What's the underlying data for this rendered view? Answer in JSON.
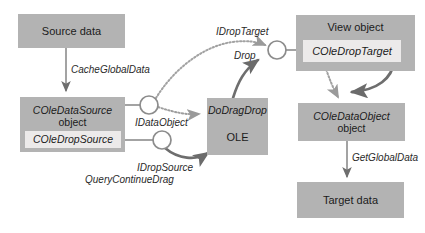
{
  "diagram": {
    "colors": {
      "box_fill": "#b3b3b3",
      "inner_fill": "#eceaea",
      "arrow_solid": "#6e6e6e",
      "arrow_dotted": "#9a9a9a",
      "text": "#1b1b1b"
    },
    "boxes": [
      {
        "id": "source-data",
        "label": "Source data",
        "sublabel": "",
        "italic": false
      },
      {
        "id": "cole-data-source",
        "label": "COleDataSource",
        "sublabel": "object",
        "italic": true
      },
      {
        "id": "cole-drop-source",
        "label": "COleDropSource",
        "sublabel": "",
        "italic": true
      },
      {
        "id": "ole",
        "label": "DoDragDrop",
        "sublabel": "OLE",
        "italic": true
      },
      {
        "id": "view-object",
        "label": "View object",
        "sublabel": "",
        "italic": false
      },
      {
        "id": "cole-drop-target",
        "label": "COleDropTarget",
        "sublabel": "",
        "italic": true
      },
      {
        "id": "cole-data-object",
        "label": "COleDataObject",
        "sublabel": "object",
        "italic": true
      },
      {
        "id": "target-data",
        "label": "Target data",
        "sublabel": "",
        "italic": false
      }
    ],
    "labels": [
      {
        "id": "cache-global-data",
        "text": "CacheGlobalData"
      },
      {
        "id": "idata-object",
        "text": "IDataObject"
      },
      {
        "id": "idrop-source",
        "text": "IDropSource"
      },
      {
        "id": "query-continue-drag",
        "text": "QueryContinueDrag"
      },
      {
        "id": "idrop-target",
        "text": "IDropTarget"
      },
      {
        "id": "drop",
        "text": "Drop"
      },
      {
        "id": "get-global-data",
        "text": "GetGlobalData"
      }
    ],
    "connectors": [
      {
        "id": "interface-node-idataobject",
        "kind": "circle"
      },
      {
        "id": "interface-node-idropsource",
        "kind": "circle"
      },
      {
        "id": "interface-node-idroptarget",
        "kind": "circle"
      }
    ]
  }
}
